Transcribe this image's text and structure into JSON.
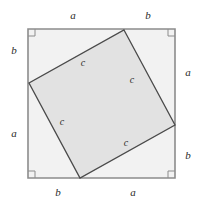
{
  "figure": {
    "name": "pythagorean-theorem-proof-diagram",
    "width": 199,
    "height": 208,
    "background_color": "#ffffff"
  },
  "colors": {
    "outer_square_fill": "#f2f2f2",
    "inner_square_fill": "#e2e2e2",
    "outer_square_stroke": "#8c8c8c",
    "inner_square_stroke": "#4a4a4a",
    "right_angle_mark_stroke": "#8c8c8c",
    "label_color": "#2b2b2b"
  },
  "outer_square": {
    "top_left": {
      "x": 28,
      "y": 29
    },
    "top_right": {
      "x": 175,
      "y": 29
    },
    "bottom_right": {
      "x": 175,
      "y": 178
    },
    "bottom_left": {
      "x": 28,
      "y": 178
    }
  },
  "inner_square": {
    "top": {
      "x": 124,
      "y": 30
    },
    "right": {
      "x": 175,
      "y": 125
    },
    "bottom": {
      "x": 80,
      "y": 178
    },
    "left": {
      "x": 29,
      "y": 83
    }
  },
  "right_angle_marks": [
    {
      "name": "right-angle-mark-top-left",
      "x": 28,
      "y": 29,
      "size": 7
    },
    {
      "name": "right-angle-mark-top-right",
      "x": 175,
      "y": 29,
      "size": 7
    },
    {
      "name": "right-angle-mark-bottom-right",
      "x": 175,
      "y": 178,
      "size": 7
    },
    {
      "name": "right-angle-mark-bottom-left",
      "x": 28,
      "y": 178,
      "size": 7
    }
  ],
  "labels": {
    "top_a": "a",
    "top_b": "b",
    "right_a": "a",
    "right_b": "b",
    "bottom_b": "b",
    "bottom_a": "a",
    "left_b": "b",
    "left_a": "a",
    "hyp_c_top": "c",
    "hyp_c_right": "c",
    "hyp_c_left": "c",
    "hyp_c_bottom": "c"
  },
  "label_positions": {
    "top_a": {
      "x": 73,
      "y": 15
    },
    "top_b": {
      "x": 148,
      "y": 15
    },
    "right_a": {
      "x": 188,
      "y": 72
    },
    "right_b": {
      "x": 188,
      "y": 155
    },
    "bottom_b": {
      "x": 58,
      "y": 192
    },
    "bottom_a": {
      "x": 133,
      "y": 192
    },
    "left_b": {
      "x": 14,
      "y": 50
    },
    "left_a": {
      "x": 14,
      "y": 133
    },
    "hyp_c_top": {
      "x": 83,
      "y": 63
    },
    "hyp_c_right": {
      "x": 132,
      "y": 80
    },
    "hyp_c_left": {
      "x": 62,
      "y": 122
    },
    "hyp_c_bottom": {
      "x": 126,
      "y": 143
    }
  }
}
